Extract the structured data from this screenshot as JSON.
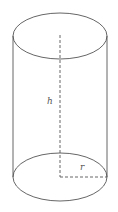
{
  "diagram": {
    "labels": {
      "height": "h",
      "radius": "r"
    },
    "colors": {
      "stroke": "#555555",
      "background": "#ffffff"
    }
  }
}
